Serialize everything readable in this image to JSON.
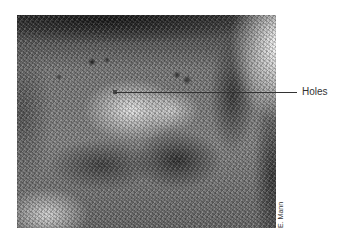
{
  "figure": {
    "callout": {
      "label": "Holes"
    },
    "credit": "E. Mann"
  }
}
